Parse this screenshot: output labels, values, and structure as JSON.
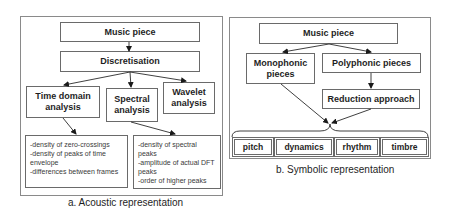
{
  "acoustic": {
    "caption": "a. Acoustic representation",
    "music_piece": "Music piece",
    "discretisation": "Discretisation",
    "time_domain": "Time domain analysis",
    "spectral": "Spectral analysis",
    "wavelet": "Wavelet analysis",
    "time_features": "-density of zero-crossings\n-density of peaks of time envelope\n-differences between frames",
    "spectral_features": "-density of spectral peaks\n-amplitude of actual DFT peaks\n-order of higher peaks"
  },
  "symbolic": {
    "caption": "b. Symbolic representation",
    "music_piece": "Music piece",
    "monophonic": "Monophonic pieces",
    "polyphonic": "Polyphonic pieces",
    "reduction": "Reduction approach",
    "features": [
      "pitch",
      "dynamics",
      "rhythm",
      "timbre"
    ]
  }
}
